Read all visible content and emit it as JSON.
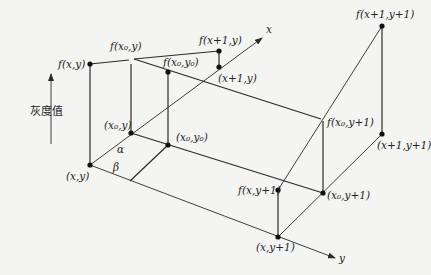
{
  "diagram": {
    "type": "bilinear-interpolation-illustration",
    "axis_label_vertical": "灰度值",
    "axes": {
      "x": "x",
      "y": "y"
    },
    "angles": {
      "alpha": "α",
      "beta": "β"
    },
    "points": [
      {
        "id": "xy",
        "label": "(x,y)",
        "value_label": "f(x,y)"
      },
      {
        "id": "x0y",
        "label": "(x₀,y)",
        "value_label": "f(x₀,y)"
      },
      {
        "id": "x0y0",
        "label": "(x₀,y₀)",
        "value_label": "f(x₀,y₀)"
      },
      {
        "id": "x1y",
        "label": "(x+1,y)",
        "value_label": "f(x+1,y)"
      },
      {
        "id": "xy1",
        "label": "(x,y+1)",
        "value_label": "f(x,y+1)"
      },
      {
        "id": "x0y1",
        "label": "(x₀,y+1)",
        "value_label": "f(x₀,y+1)"
      },
      {
        "id": "x1y1",
        "label": "(x+1,y+1)",
        "value_label": "f(x+1,y+1)"
      }
    ]
  },
  "labels": {
    "f_xy": "f(x,y)",
    "f_x0y": "f(x₀,y)",
    "f_x0y0": "f(x₀,y₀)",
    "f_x1y": "f(x+1,y)",
    "f_x1y1": "f(x+1,y+1)",
    "f_x0y1": "f(x₀,y+1)",
    "f_xy1": "f(x,y+1)",
    "xy": "(x,y)",
    "x0y": "(x₀,y)",
    "x0y0": "(x₀,y₀)",
    "x1y": "(x+1,y)",
    "x1y1": "(x+1,y+1)",
    "x0y1": "(x₀,y+1)",
    "xy1": "(x,y+1)",
    "x_axis": "x",
    "y_axis": "y",
    "alpha": "α",
    "beta": "β",
    "gray_value": "灰度值"
  }
}
